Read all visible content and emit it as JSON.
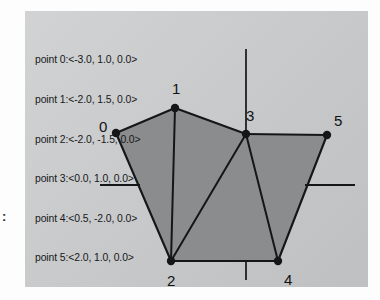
{
  "figure": {
    "coordinate_list": [
      "point 0:<-3.0, 1.0, 0.0>",
      "point 1:<-2.0, 1.5, 0.0>",
      "point 2:<-2.0, -1.5, 0.0>",
      "point 3:<0.0, 1.0, 0.0>",
      "point 4:<0.5, -2.0, 0.0>",
      "point 5:<2.0, 1.0, 0.0>"
    ],
    "vertex_labels": [
      "0",
      "1",
      "2",
      "3",
      "4",
      "5"
    ],
    "margin_mark": ":",
    "colors": {
      "panel_background": "#c9cacb",
      "polygon_fill": "#8b8c8d",
      "stroke": "#141618",
      "text": "#16181a",
      "page_background": "#fdfdfd"
    }
  },
  "chart_data": {
    "type": "scatter",
    "title": "",
    "xlabel": "",
    "ylabel": "",
    "xlim": [
      -3.5,
      2.5
    ],
    "ylim": [
      -2.5,
      2.0
    ],
    "grid": false,
    "legend": null,
    "annotations": [
      "point 0:<-3.0, 1.0, 0.0>",
      "point 1:<-2.0, 1.5, 0.0>",
      "point 2:<-2.0, -1.5, 0.0>",
      "point 3:<0.0, 1.0, 0.0>",
      "point 4:<0.5, -2.0, 0.0>",
      "point 5:<2.0, 1.0, 0.0>"
    ],
    "points": [
      {
        "id": 0,
        "label": "0",
        "x": -3.0,
        "y": 1.0,
        "z": 0.0,
        "px": 91,
        "py": 122
      },
      {
        "id": 1,
        "label": "1",
        "x": -2.0,
        "y": 1.5,
        "z": 0.0,
        "px": 150,
        "py": 97
      },
      {
        "id": 2,
        "label": "2",
        "x": -2.0,
        "y": -1.5,
        "z": 0.0,
        "px": 146,
        "py": 250
      },
      {
        "id": 3,
        "label": "3",
        "x": 0.0,
        "y": 1.0,
        "z": 0.0,
        "px": 221,
        "py": 123
      },
      {
        "id": 4,
        "label": "4",
        "x": 0.5,
        "y": -2.0,
        "z": 0.0,
        "px": 253,
        "py": 250
      },
      {
        "id": 5,
        "label": "5",
        "x": 2.0,
        "y": 1.0,
        "z": 0.0,
        "px": 302,
        "py": 124
      }
    ],
    "boundary_edges": [
      [
        0,
        1
      ],
      [
        1,
        3
      ],
      [
        3,
        5
      ],
      [
        5,
        4
      ],
      [
        4,
        2
      ],
      [
        2,
        0
      ]
    ],
    "diagonal_edges": [
      [
        1,
        2
      ],
      [
        3,
        2
      ],
      [
        3,
        4
      ]
    ],
    "axes": {
      "y_axis": {
        "px": 221,
        "y_top": 38,
        "y_bottom": 123
      },
      "y_axis_tick_below": {
        "px": 221,
        "y_top": 250,
        "y_bottom": 269
      },
      "x_axis_left": {
        "py": 174,
        "x_start": 75,
        "x_end": 115
      },
      "x_axis_right": {
        "py": 174,
        "x_start": 280,
        "x_end": 330
      }
    }
  }
}
